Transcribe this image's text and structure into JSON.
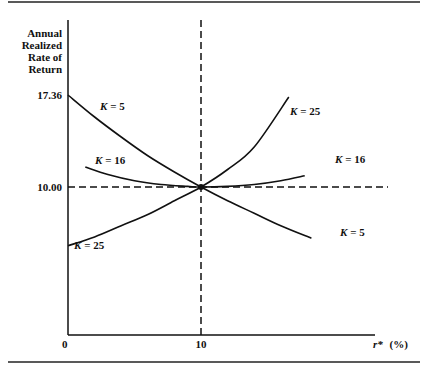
{
  "chart_data": {
    "type": "line",
    "title": "",
    "ylabel_lines": [
      "Annual",
      "Realized",
      "Rate of",
      "Return"
    ],
    "xlabel": "r* (%)",
    "xlabel_var": "r*",
    "xlabel_unit": "(%)",
    "x_ticks": [
      {
        "value": 0,
        "label": "0"
      },
      {
        "value": 10,
        "label": "10"
      }
    ],
    "y_ticks": [
      {
        "value": 10.0,
        "label": "10.00"
      },
      {
        "value": 17.36,
        "label": "17.36"
      }
    ],
    "xlim": [
      0,
      20
    ],
    "ylim": [
      0,
      20
    ],
    "reference_lines": [
      {
        "orientation": "horizontal",
        "value": 10.0,
        "style": "dashed"
      },
      {
        "orientation": "vertical",
        "value": 10,
        "style": "dashed"
      }
    ],
    "intersection_point": {
      "x": 10,
      "y": 10.0
    },
    "series": [
      {
        "name": "K = 5",
        "label_k": "K",
        "label_val": "= 5",
        "x": [
          0,
          2,
          4,
          6,
          8,
          10,
          12,
          14,
          16,
          18.3
        ],
        "y": [
          17.36,
          15.6,
          14.0,
          12.5,
          11.2,
          10.0,
          8.9,
          7.9,
          6.9,
          5.9
        ]
      },
      {
        "name": "K = 16",
        "label_k": "K",
        "label_val": "= 16",
        "x": [
          1.3,
          3,
          5,
          7,
          9,
          10,
          12,
          14,
          16,
          17.8
        ],
        "y": [
          11.6,
          11.0,
          10.5,
          10.2,
          10.05,
          10.0,
          10.05,
          10.2,
          10.5,
          10.9
        ]
      },
      {
        "name": "K = 25",
        "label_k": "K",
        "label_val": "= 25",
        "x": [
          0,
          2,
          4,
          6,
          8,
          10,
          12,
          14,
          16.6
        ],
        "y": [
          5.3,
          6.0,
          6.9,
          7.8,
          8.9,
          10.0,
          11.4,
          13.2,
          17.2
        ]
      }
    ],
    "labels_note": "Each curve is labeled twice: K=5 near top-left and lower-right; K=16 near left and right; K=25 near lower-left and upper-right",
    "grid": false,
    "legend": "none"
  }
}
